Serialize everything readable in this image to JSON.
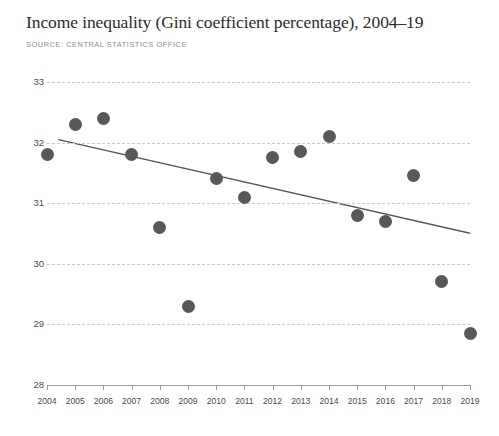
{
  "header": {
    "title": "Income inequality (Gini coefficient percentage), 2004–19",
    "source": "SOURCE: CENTRAL STATISTICS OFFICE"
  },
  "colors": {
    "marker": "#585858",
    "trendline": "#555555",
    "gridline": "#c9c9c9",
    "axis": "#9a9a9a",
    "title_text": "#2b2b2b",
    "source_text": "#8d8d8d",
    "background": "#ffffff"
  },
  "chart_data": {
    "type": "scatter",
    "title": "Income inequality (Gini coefficient percentage), 2004–19",
    "subtitle": "SOURCE: CENTRAL STATISTICS OFFICE",
    "xlabel": "",
    "ylabel": "",
    "x": [
      2004,
      2005,
      2006,
      2007,
      2008,
      2009,
      2010,
      2011,
      2012,
      2013,
      2014,
      2015,
      2016,
      2017,
      2018,
      2019
    ],
    "categories": [
      "2004",
      "2005",
      "2006",
      "2007",
      "2008",
      "2009",
      "2010",
      "2011",
      "2012",
      "2013",
      "2014",
      "2015",
      "2016",
      "2017",
      "2018",
      "2019"
    ],
    "values": [
      31.8,
      32.3,
      32.4,
      31.8,
      30.6,
      29.3,
      31.4,
      31.1,
      31.75,
      31.85,
      32.1,
      30.8,
      30.7,
      31.45,
      29.7,
      28.85
    ],
    "series": [
      {
        "name": "Gini coefficient percentage",
        "values": [
          31.8,
          32.3,
          32.4,
          31.8,
          30.6,
          29.3,
          31.4,
          31.1,
          31.75,
          31.85,
          32.1,
          30.8,
          30.7,
          31.45,
          29.7,
          28.85
        ]
      }
    ],
    "trendline": {
      "type": "linear",
      "start": {
        "x": 2004.4,
        "y": 32.05
      },
      "end": {
        "x": 2019.5,
        "y": 30.45
      }
    },
    "ylim": [
      28,
      33
    ],
    "yticks": [
      28,
      29,
      30,
      31,
      32,
      33
    ],
    "ytick_labels": [
      "28",
      "29",
      "30",
      "31",
      "32",
      "33"
    ],
    "xlim": [
      2004,
      2019
    ],
    "xticks": [
      2004,
      2005,
      2006,
      2007,
      2008,
      2009,
      2010,
      2011,
      2012,
      2013,
      2014,
      2015,
      2016,
      2017,
      2018,
      2019
    ],
    "grid": true,
    "grid_style": "dashed-horizontal",
    "legend": null,
    "legend_position": "none"
  }
}
